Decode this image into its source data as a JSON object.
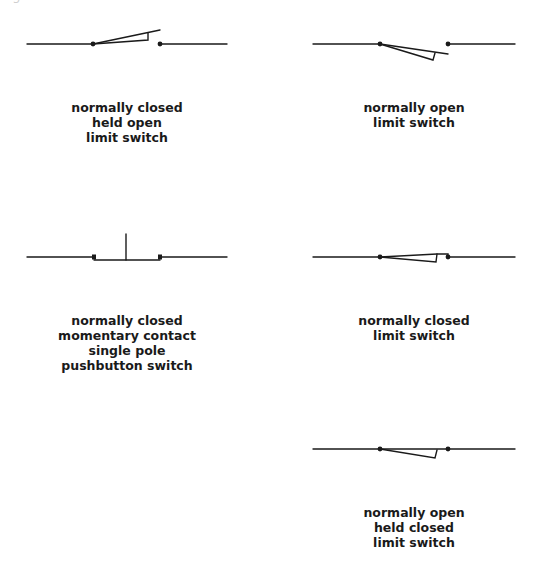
{
  "figure": {
    "clipped_title": "Figure"
  },
  "colors": {
    "line": "#1a1a1a",
    "background": "#ffffff"
  },
  "symbols": [
    {
      "id": "nc-held-open-limit-switch",
      "caption": [
        "normally closed",
        "held open",
        "limit switch"
      ]
    },
    {
      "id": "no-limit-switch",
      "caption": [
        "normally open",
        "limit switch"
      ]
    },
    {
      "id": "nc-momentary-pushbutton",
      "caption": [
        "normally closed",
        "momentary contact",
        "single pole",
        "pushbutton switch"
      ]
    },
    {
      "id": "nc-limit-switch",
      "caption": [
        "normally closed",
        "limit switch"
      ]
    },
    {
      "id": "no-held-closed-limit-switch",
      "caption": [
        "normally open",
        "held closed",
        "limit switch"
      ]
    }
  ]
}
